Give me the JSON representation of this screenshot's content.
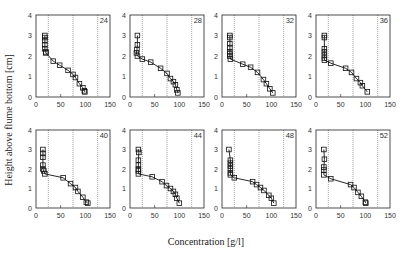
{
  "chart_data": {
    "type": "line",
    "xlabel": "Concentration [g/l]",
    "ylabel": "Height above flume bottom [cm]",
    "xlim": [
      0,
      150
    ],
    "ylim": [
      0,
      4
    ],
    "xticks": [
      0,
      50,
      100,
      150
    ],
    "yticks": [
      0,
      1,
      2,
      3,
      4
    ],
    "reference_lines_x": [
      25,
      75,
      125
    ],
    "marker": "open-square",
    "grid": false,
    "panels": [
      {
        "label": "24",
        "x": [
          18,
          18,
          18,
          18,
          18,
          20,
          20,
          35,
          48,
          65,
          75,
          80,
          88,
          95,
          98,
          99
        ],
        "y": [
          3.0,
          2.9,
          2.75,
          2.55,
          2.35,
          2.2,
          2.15,
          1.75,
          1.55,
          1.3,
          1.1,
          0.95,
          0.65,
          0.45,
          0.3,
          0.25
        ]
      },
      {
        "label": "28",
        "x": [
          15,
          15,
          14,
          13,
          15,
          25,
          42,
          62,
          75,
          82,
          88,
          92,
          95,
          97
        ],
        "y": [
          3.0,
          2.55,
          2.3,
          2.15,
          2.0,
          1.85,
          1.7,
          1.4,
          1.15,
          0.9,
          0.75,
          0.6,
          0.35,
          0.2
        ]
      },
      {
        "label": "32",
        "x": [
          16,
          16,
          16,
          16,
          16,
          16,
          16,
          17,
          42,
          58,
          72,
          84,
          90,
          97,
          103
        ],
        "y": [
          3.0,
          2.9,
          2.6,
          2.4,
          2.2,
          2.1,
          2.0,
          1.85,
          1.6,
          1.45,
          1.2,
          0.85,
          0.65,
          0.4,
          0.2
        ]
      },
      {
        "label": "36",
        "x": [
          17,
          17,
          17,
          17,
          17,
          17,
          17,
          30,
          60,
          72,
          82,
          90,
          94,
          104
        ],
        "y": [
          3.0,
          2.9,
          2.35,
          2.2,
          2.05,
          1.9,
          1.8,
          1.65,
          1.4,
          1.2,
          0.9,
          0.7,
          0.55,
          0.25
        ]
      },
      {
        "label": "40",
        "x": [
          14,
          14,
          14,
          14,
          14,
          16,
          18,
          55,
          70,
          80,
          85,
          95,
          102,
          105
        ],
        "y": [
          3.0,
          2.8,
          2.6,
          2.2,
          2.0,
          1.9,
          1.75,
          1.55,
          1.25,
          1.05,
          0.85,
          0.55,
          0.3,
          0.25
        ]
      },
      {
        "label": "44",
        "x": [
          17,
          18,
          17,
          17,
          17,
          17,
          17,
          45,
          65,
          74,
          82,
          88,
          92,
          95,
          100
        ],
        "y": [
          3.0,
          2.85,
          2.45,
          2.2,
          2.0,
          1.9,
          1.75,
          1.6,
          1.35,
          1.15,
          1.0,
          0.85,
          0.7,
          0.5,
          0.25
        ]
      },
      {
        "label": "48",
        "x": [
          14,
          17,
          17,
          17,
          17,
          17,
          17,
          25,
          62,
          70,
          78,
          85,
          95,
          100,
          105
        ],
        "y": [
          3.0,
          2.45,
          2.3,
          2.15,
          2.0,
          1.8,
          1.7,
          1.55,
          1.35,
          1.2,
          1.05,
          0.9,
          0.65,
          0.5,
          0.25
        ]
      },
      {
        "label": "52",
        "x": [
          16,
          17,
          16,
          16,
          16,
          30,
          70,
          77,
          85,
          92,
          100,
          101
        ],
        "y": [
          3.0,
          2.5,
          2.1,
          1.95,
          1.7,
          1.5,
          1.2,
          1.05,
          0.8,
          0.6,
          0.3,
          0.25
        ]
      }
    ]
  }
}
